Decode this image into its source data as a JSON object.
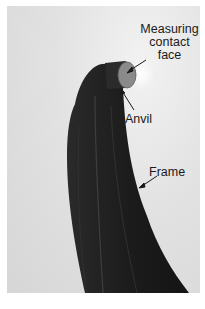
{
  "figure": {
    "background_color": "#dcdcdc",
    "frame_color": "#1f1f1f",
    "anvil_face_color": "#8a8a8a",
    "labels": {
      "measuring_contact_face": {
        "line1": "Measuring",
        "line2": "contact",
        "line3": "face"
      },
      "anvil": "Anvil",
      "frame": "Frame"
    }
  }
}
